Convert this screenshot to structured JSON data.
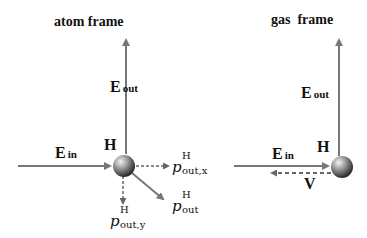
{
  "left_panel": {
    "title": "atom frame",
    "E_out": {
      "main": "E",
      "sub": "out"
    },
    "E_in": {
      "main": "E",
      "sub": "in"
    },
    "atom_label": "H",
    "p_out_x": {
      "main": "p",
      "sup": "H",
      "sub": "out,x"
    },
    "p_out_y": {
      "main": "p",
      "sup": "H",
      "sub": "out,y"
    },
    "p_out": {
      "main": "p",
      "sup": "H",
      "sub": "out"
    }
  },
  "right_panel": {
    "title": "gas  frame",
    "E_out": {
      "main": "E",
      "sub": "out"
    },
    "E_in": {
      "main": "E",
      "sub": "in"
    },
    "atom_label": "H",
    "velocity_label": "V"
  },
  "colors": {
    "arrow": "#777777",
    "dashed_arrow": "#666666",
    "sphere_light": "#dddddd",
    "sphere_dark": "#333333",
    "text": "#111111"
  }
}
